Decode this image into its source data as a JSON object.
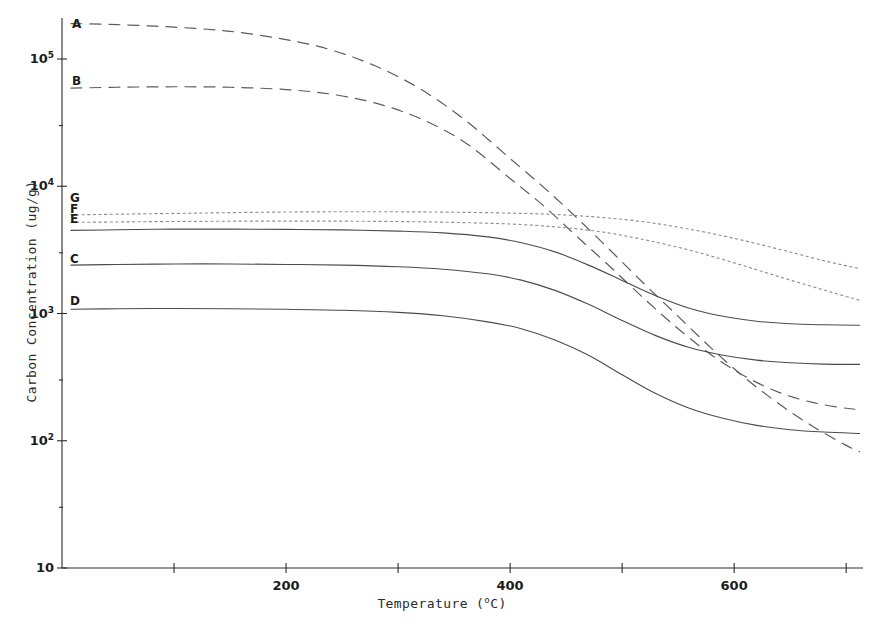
{
  "chart_data": {
    "type": "line",
    "title": "",
    "xlabel": "Temperature (°C)",
    "xlabel_main": "Temperature (",
    "xlabel_sup": "o",
    "xlabel_tail": "C)",
    "ylabel": "Carbon Concentration (ug/g)",
    "xscale": "linear",
    "yscale": "log",
    "xlim": [
      0,
      715
    ],
    "ylim": [
      10,
      300000
    ],
    "grid": false,
    "legend": "inline-curve-labels-at-left",
    "xticks": [
      0,
      100,
      200,
      300,
      400,
      500,
      600,
      700
    ],
    "xtick_labels": [
      "",
      "",
      "200",
      "",
      "400",
      "",
      "600",
      ""
    ],
    "xtick_labels_shown": [
      "200",
      "400",
      "600"
    ],
    "yticks": [
      10,
      100,
      1000,
      10000,
      100000
    ],
    "ytick_labels": [
      "10",
      "10²",
      "10³",
      "10⁴",
      "10⁵"
    ],
    "ytick_mantissa": [
      "10",
      "10",
      "10",
      "10",
      "10"
    ],
    "ytick_exponent": [
      "",
      "2",
      "3",
      "4",
      "5"
    ],
    "series": [
      {
        "name": "A",
        "label": "A",
        "style": "dashed",
        "color": "#5a5c62",
        "x": [
          8,
          50,
          100,
          150,
          200,
          240,
          280,
          320,
          360,
          400,
          430,
          460,
          490,
          520,
          550,
          580,
          610,
          640,
          670,
          700,
          712
        ],
        "y": [
          190000,
          186000,
          178000,
          165000,
          142000,
          118000,
          88000,
          58000,
          33000,
          16500,
          9800,
          5600,
          3100,
          1700,
          950,
          530,
          310,
          195,
          130,
          92,
          82
        ]
      },
      {
        "name": "B",
        "label": "B",
        "style": "dashed",
        "color": "#5a5c62",
        "x": [
          8,
          50,
          100,
          150,
          200,
          240,
          280,
          320,
          360,
          400,
          430,
          460,
          490,
          520,
          550,
          580,
          610,
          640,
          670,
          700,
          712
        ],
        "y": [
          59000,
          60000,
          60500,
          60000,
          57500,
          53000,
          45000,
          34000,
          22000,
          11500,
          7000,
          4000,
          2300,
          1300,
          760,
          470,
          320,
          240,
          200,
          180,
          176
        ]
      },
      {
        "name": "C",
        "label": "C",
        "style": "solid",
        "color": "#4a4c51",
        "x": [
          8,
          50,
          100,
          150,
          200,
          250,
          300,
          340,
          380,
          410,
          440,
          470,
          500,
          530,
          560,
          590,
          620,
          650,
          680,
          712
        ],
        "y": [
          2400,
          2430,
          2450,
          2450,
          2430,
          2400,
          2330,
          2230,
          2050,
          1830,
          1520,
          1180,
          880,
          670,
          540,
          470,
          430,
          410,
          400,
          398
        ]
      },
      {
        "name": "D",
        "label": "D",
        "style": "solid",
        "color": "#4a4c51",
        "x": [
          8,
          50,
          100,
          150,
          200,
          250,
          300,
          340,
          380,
          410,
          440,
          470,
          500,
          530,
          560,
          590,
          620,
          650,
          680,
          712
        ],
        "y": [
          1080,
          1090,
          1095,
          1090,
          1080,
          1060,
          1020,
          960,
          860,
          760,
          620,
          470,
          330,
          235,
          180,
          150,
          132,
          122,
          117,
          114
        ]
      },
      {
        "name": "E",
        "label": "E",
        "style": "solid",
        "color": "#4a4c51",
        "x": [
          8,
          50,
          100,
          150,
          200,
          250,
          300,
          340,
          380,
          410,
          440,
          470,
          500,
          530,
          560,
          590,
          620,
          650,
          680,
          712
        ],
        "y": [
          4500,
          4550,
          4600,
          4600,
          4580,
          4540,
          4440,
          4300,
          4000,
          3600,
          3050,
          2400,
          1820,
          1380,
          1100,
          950,
          870,
          830,
          815,
          808
        ]
      },
      {
        "name": "F",
        "label": "F",
        "style": "dotted",
        "color": "#8d9097",
        "x": [
          8,
          60,
          120,
          180,
          240,
          300,
          350,
          400,
          440,
          480,
          520,
          560,
          600,
          640,
          680,
          712
        ],
        "y": [
          5200,
          5250,
          5300,
          5320,
          5320,
          5280,
          5200,
          5050,
          4800,
          4400,
          3800,
          3150,
          2500,
          1950,
          1530,
          1270
        ]
      },
      {
        "name": "G",
        "label": "G",
        "style": "dotted",
        "color": "#8d9097",
        "x": [
          8,
          60,
          120,
          180,
          240,
          300,
          350,
          400,
          440,
          480,
          520,
          560,
          600,
          640,
          680,
          712
        ],
        "y": [
          5950,
          6050,
          6150,
          6250,
          6300,
          6300,
          6250,
          6150,
          6000,
          5700,
          5250,
          4600,
          3900,
          3200,
          2600,
          2250
        ]
      }
    ],
    "curve_labels": [
      {
        "text": "A",
        "x_px": 72,
        "y_px": 18
      },
      {
        "text": "B",
        "x_px": 72,
        "y_px": 75
      },
      {
        "text": "G",
        "x_px": 70,
        "y_px": 192
      },
      {
        "text": "F",
        "x_px": 70,
        "y_px": 203
      },
      {
        "text": "E",
        "x_px": 70,
        "y_px": 213
      },
      {
        "text": "C",
        "x_px": 70,
        "y_px": 253
      },
      {
        "text": "D",
        "x_px": 70,
        "y_px": 295
      }
    ]
  },
  "axes": {
    "x_title_text": "Temperature (",
    "x_title_sup": "o",
    "x_title_end": "C)",
    "y_title_text": "Carbon Concentration (ug/g)"
  }
}
